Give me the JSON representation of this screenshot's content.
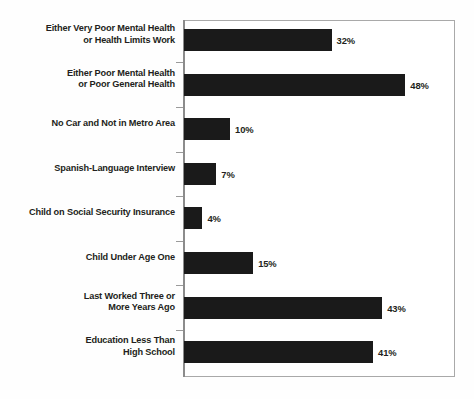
{
  "figure": {
    "background_color": "#ffffff",
    "bar_color": "#1a1a1a",
    "text_color": "#231f20",
    "frame_color": "#a9a9a9"
  },
  "chart_data": {
    "type": "bar",
    "orientation": "horizontal",
    "title": "",
    "subtitle": "",
    "xlabel": "",
    "ylabel": "",
    "xlim": [
      0,
      59
    ],
    "grid": false,
    "legend": null,
    "value_suffix": "%",
    "categories": [
      "Either Very Poor Mental Health\nor Health Limits Work",
      "Either Poor Mental Health\nor Poor General Health",
      "No Car and Not in Metro Area",
      "Spanish-Language Interview",
      "Child on Social Security Insurance",
      "Child Under Age One",
      "Last Worked Three or\nMore Years Ago",
      "Education Less Than\nHigh School"
    ],
    "values": [
      32,
      48,
      10,
      7,
      4,
      15,
      43,
      41
    ],
    "data_labels": [
      "32%",
      "48%",
      "10%",
      "7%",
      "4%",
      "15%",
      "43%",
      "41%"
    ],
    "bars": [
      {
        "label_line1": "Either Very Poor Mental Health",
        "label_line2": "or Health Limits Work",
        "value": 32,
        "data_label": "32%"
      },
      {
        "label_line1": "Either Poor Mental Health",
        "label_line2": "or Poor General Health",
        "value": 48,
        "data_label": "48%"
      },
      {
        "label_line1": "No Car and Not in Metro Area",
        "label_line2": "",
        "value": 10,
        "data_label": "10%"
      },
      {
        "label_line1": "Spanish-Language Interview",
        "label_line2": "",
        "value": 7,
        "data_label": "7%"
      },
      {
        "label_line1": "Child on Social Security Insurance",
        "label_line2": "",
        "value": 4,
        "data_label": "4%"
      },
      {
        "label_line1": "Child Under Age One",
        "label_line2": "",
        "value": 15,
        "data_label": "15%"
      },
      {
        "label_line1": "Last Worked Three or",
        "label_line2": "More Years Ago",
        "value": 43,
        "data_label": "43%"
      },
      {
        "label_line1": "Education Less Than",
        "label_line2": "High School",
        "value": 41,
        "data_label": "41%"
      }
    ]
  }
}
